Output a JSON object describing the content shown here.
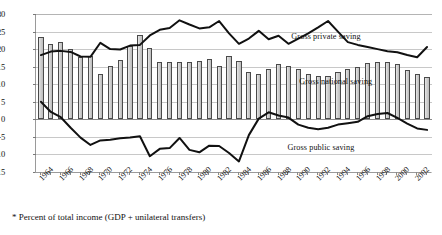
{
  "chart_data": {
    "type": "bar",
    "title": "",
    "subtitle": "",
    "xlabel": "",
    "ylabel": "",
    "ylim": [
      -15,
      30
    ],
    "ytick_step": 5,
    "yticks": [
      "30",
      "25",
      "20",
      "15",
      "10",
      "5",
      "0",
      "-5",
      "-10",
      "-15"
    ],
    "grid": true,
    "legend_position": "inline-annotations",
    "footnote": "* Percent of total income (GDP + unilateral transfers)",
    "x": [
      1964,
      1965,
      1966,
      1967,
      1968,
      1969,
      1970,
      1971,
      1972,
      1973,
      1974,
      1975,
      1976,
      1977,
      1978,
      1979,
      1980,
      1981,
      1982,
      1983,
      1984,
      1985,
      1986,
      1987,
      1988,
      1989,
      1990,
      1991,
      1992,
      1993,
      1994,
      1995,
      1996,
      1997,
      1998,
      1999,
      2000,
      2001,
      2002,
      2003
    ],
    "xtick_labels": [
      "1964",
      "1966",
      "1968",
      "1970",
      "1972",
      "1974",
      "1976",
      "1978",
      "1980",
      "1982",
      "1984",
      "1986",
      "1988",
      "1990",
      "1992",
      "1994",
      "1996",
      "1998",
      "2000",
      "2002"
    ],
    "series": [
      {
        "name": "Gross national saving",
        "type": "bar",
        "color": "#d2d2d2",
        "edge_color": "#4a4a4a",
        "annotation": "Gross national saving",
        "values": [
          23.4,
          21.4,
          22.1,
          20.0,
          17.8,
          17.9,
          12.8,
          15.3,
          16.9,
          20.8,
          24.1,
          20.3,
          16.2,
          16.3,
          16.3,
          16.4,
          16.6,
          17.2,
          15.3,
          17.9,
          16.7,
          13.4,
          13.0,
          14.3,
          15.8,
          15.1,
          14.3,
          13.0,
          12.2,
          12.4,
          13.5,
          14.2,
          14.8,
          16.0,
          16.4,
          16.2,
          15.9,
          14.1,
          12.8,
          12.1
        ]
      },
      {
        "name": "Gross private saving",
        "type": "line",
        "color": "#111111",
        "annotation": "Gross private saving",
        "values": [
          18.3,
          19.3,
          19.5,
          19.2,
          17.9,
          17.8,
          21.8,
          20.0,
          19.9,
          21.0,
          21.2,
          23.9,
          25.5,
          26.0,
          28.2,
          27.0,
          25.9,
          26.2,
          28.0,
          24.5,
          21.5,
          23.0,
          25.2,
          22.8,
          23.8,
          21.5,
          23.0,
          24.5,
          26.2,
          28.0,
          25.0,
          22.0,
          21.2,
          20.6,
          20.0,
          19.4,
          19.1,
          18.3,
          17.7,
          20.6
        ]
      },
      {
        "name": "Gross public saving",
        "type": "line",
        "color": "#111111",
        "annotation": "Gross public saving",
        "values": [
          5.0,
          2.1,
          0.6,
          -2.4,
          -5.2,
          -7.3,
          -6.0,
          -5.8,
          -5.4,
          -5.2,
          -4.8,
          -10.5,
          -8.4,
          -8.2,
          -5.3,
          -8.7,
          -9.4,
          -7.5,
          -7.6,
          -9.6,
          -12.0,
          -4.5,
          0.2,
          2.0,
          1.1,
          0.5,
          -1.5,
          -2.4,
          -2.8,
          -2.4,
          -1.5,
          -1.1,
          -0.7,
          0.9,
          1.5,
          1.8,
          0.4,
          -1.2,
          -2.6,
          -3.0
        ]
      }
    ]
  }
}
